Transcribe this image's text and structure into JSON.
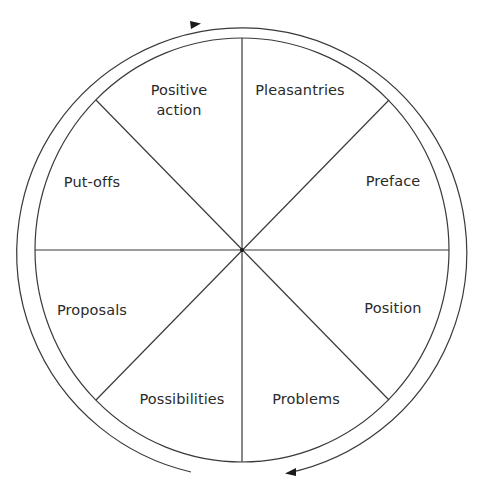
{
  "diagram": {
    "type": "cycle-wheel",
    "direction": "clockwise",
    "center": [
      242,
      250
    ],
    "inner_radius": 210,
    "outer_radius": 225,
    "stroke_color": "#3a3a3a",
    "segments": [
      {
        "label": "Pleasantries",
        "x": 300,
        "y": 90
      },
      {
        "label": "Preface",
        "x": 392,
        "y": 181
      },
      {
        "label": "Position",
        "x": 392,
        "y": 309
      },
      {
        "label": "Problems",
        "x": 306,
        "y": 399
      },
      {
        "label": "Possibilities",
        "x": 182,
        "y": 399
      },
      {
        "label": "Proposals",
        "x": 92,
        "y": 310
      },
      {
        "label": "Put-offs",
        "x": 92,
        "y": 182
      },
      {
        "label_line1": "Positive",
        "label_line2": "action",
        "x": 179,
        "y": 100
      }
    ]
  }
}
